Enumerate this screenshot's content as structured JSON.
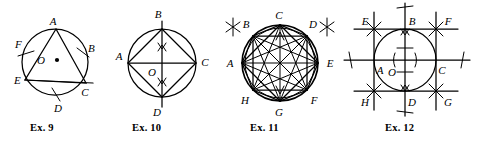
{
  "page": {
    "background_color": "#ffffff",
    "ink_color": "#000000",
    "kind": "geometry-exercise-figures",
    "figure_count": 4
  },
  "figures": [
    {
      "id": "ex9",
      "caption": "Ex. 9",
      "description": "Circle with center O and an inscribed triangle",
      "center_label": "O",
      "center_marker": "dot",
      "labels": [
        "A",
        "B",
        "C",
        "D",
        "E",
        "F",
        "O"
      ],
      "point_labels": {
        "A": "A",
        "B": "B",
        "C": "C",
        "D": "D",
        "E": "E",
        "F": "F",
        "O": "O"
      },
      "inscribed_polygon": [
        "A",
        "E",
        "C"
      ],
      "arc_tick_points": [
        "F",
        "B",
        "D"
      ],
      "chord_extends_past": "C"
    },
    {
      "id": "ex10",
      "caption": "Ex. 10",
      "description": "Circle with perpendicular diameters and inscribed quadrilateral",
      "center_label": "O",
      "labels": [
        "A",
        "B",
        "C",
        "D",
        "O"
      ],
      "point_labels": {
        "A": "A",
        "B": "B",
        "C": "C",
        "D": "D",
        "O": "O"
      },
      "inscribed_polygon": [
        "A",
        "B",
        "C",
        "D"
      ],
      "diameters": [
        "A-C",
        "B-D"
      ],
      "arrow_marks": [
        "upper-vertical",
        "lower-vertical"
      ],
      "vertical_line_extends": true
    },
    {
      "id": "ex11",
      "caption": "Ex. 11",
      "description": "Circle with inscribed regular octagon and all diagonals",
      "labels": [
        "A",
        "B",
        "C",
        "D",
        "E",
        "F",
        "G",
        "H"
      ],
      "point_labels": {
        "A": "A",
        "B": "B",
        "C": "C",
        "D": "D",
        "E": "E",
        "F": "F",
        "G": "G",
        "H": "H"
      },
      "inscribed_polygon": [
        "A",
        "B",
        "C",
        "D",
        "E",
        "F",
        "G",
        "H"
      ],
      "inscribed_square": [
        "A",
        "C",
        "E",
        "G"
      ],
      "star_marks": [
        "outside-B",
        "outside-D"
      ],
      "all_diagonals": true
    },
    {
      "id": "ex12",
      "caption": "Ex. 12",
      "description": "Circle inscribed in a square, tangent points labeled",
      "center_label": "O",
      "labels": [
        "A",
        "B",
        "C",
        "D",
        "E",
        "F",
        "G",
        "H",
        "O"
      ],
      "point_labels": {
        "A": "A",
        "B": "B",
        "C": "C",
        "D": "D",
        "E": "E",
        "F": "F",
        "G": "G",
        "H": "H",
        "O": "O"
      },
      "circumscribed_square": [
        "E",
        "F",
        "G",
        "H"
      ],
      "tangent_points": [
        "A",
        "B",
        "C",
        "D"
      ],
      "star_marks": [
        "corner-E",
        "corner-F",
        "corner-G",
        "corner-H"
      ],
      "tick_marks": [
        "center-horizontal",
        "center-vertical",
        "left-axis-end",
        "right-axis-end",
        "top-axis-end",
        "bottom-axis-end"
      ],
      "axes_extend_beyond_square": true
    }
  ]
}
